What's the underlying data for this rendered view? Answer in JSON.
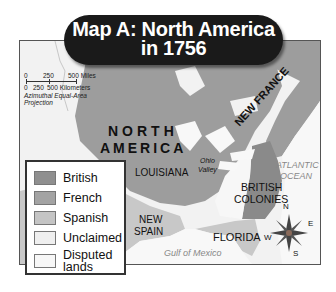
{
  "title": {
    "line1": "Map A:  North America",
    "line2": "in 1756"
  },
  "scale": {
    "miles": [
      "0",
      "250",
      "500 Miles"
    ],
    "kilometers": [
      "0",
      "250",
      "500 Kilometers"
    ],
    "projection": "Azimuthal Equal-Area Projection"
  },
  "labels": {
    "north": "NORTH",
    "america": "AMERICA",
    "new_france": "NEW FRANCE",
    "louisiana": "LOUISIANA",
    "ohio": "Ohio",
    "valley": "Valley",
    "atlantic": "ATLANTIC",
    "ocean": "OCEAN",
    "british": "BRITISH",
    "colonies": "COLONIES",
    "new": "NEW",
    "spain": "SPAIN",
    "florida": "FLORIDA",
    "gulf": "Gulf of Mexico"
  },
  "compass": {
    "n": "N",
    "e": "E",
    "s": "S",
    "w": "W"
  },
  "legend": {
    "items": [
      {
        "label": "British",
        "color": "#8f8f8f"
      },
      {
        "label": "French",
        "color": "#a3a3a3"
      },
      {
        "label": "Spanish",
        "color": "#c4c4c4"
      },
      {
        "label": "Unclaimed",
        "color": "#efefef"
      },
      {
        "label": "Disputed",
        "label2": "lands",
        "color": "#f7f7f7"
      }
    ]
  },
  "colors": {
    "french": "#9d9d9d",
    "british": "#8a8a8a",
    "spanish": "#c8c8c8",
    "unclaimed": "#f2f2f2",
    "water": "#f8f8f8"
  }
}
